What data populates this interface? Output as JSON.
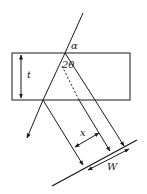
{
  "diagram": {
    "labels": {
      "alpha": "α",
      "two_theta": "2θ",
      "thickness": "t",
      "spacing": "x",
      "width": "W"
    },
    "colors": {
      "stroke": "#1a1a1a",
      "background": "#ffffff"
    }
  }
}
